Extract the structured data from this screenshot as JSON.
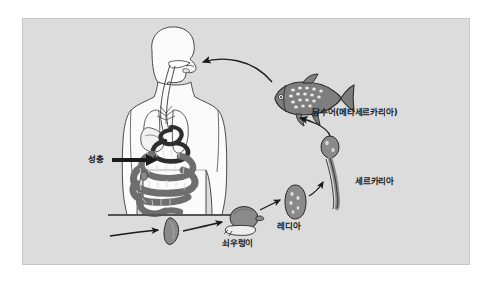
{
  "diagram": {
    "panel": {
      "background_color": "#dcdcdc",
      "border_color": "#c6c6c6"
    },
    "colors": {
      "organism_fill": "#8a8a8a",
      "organism_stroke": "#2b2b2b",
      "worm_fill": "#6e6e6e",
      "worm_dark": "#2e2e2e",
      "body_outline": "#4a4a4a",
      "body_fill": "#fbfbfb",
      "arrow_color": "#1a1a1a",
      "ground_line": "#555555",
      "label_color": "#1a1a1a"
    },
    "stages": [
      {
        "id": "adult",
        "label": "성충",
        "role": "adult-fluke-in-human-host",
        "x": 88,
        "y": 155
      },
      {
        "id": "egg",
        "label": "",
        "role": "egg-shed-to-water",
        "x": 170,
        "y": 228
      },
      {
        "id": "snail",
        "label": "쇠우렁이",
        "role": "first-intermediate-host-snail",
        "x": 222,
        "y": 239
      },
      {
        "id": "redia",
        "label": "레디아",
        "role": "redia-stage-in-snail",
        "x": 277,
        "y": 222
      },
      {
        "id": "cercaria",
        "label": "세르카리아",
        "role": "cercaria-free-swimming",
        "x": 355,
        "y": 177
      },
      {
        "id": "fish",
        "label": "담수어(메타세르카리아)",
        "role": "second-intermediate-host-freshwater-fish",
        "x": 312,
        "y": 108
      }
    ],
    "human": {
      "role": "definitive-host-human",
      "organs": [
        "mouth",
        "esophagus",
        "lungs",
        "liver",
        "intestines"
      ]
    },
    "arrows": [
      {
        "id": "fish-to-mouth",
        "from": "fish",
        "to": "human-mouth"
      },
      {
        "id": "cercaria-to-fish",
        "from": "cercaria",
        "to": "fish"
      },
      {
        "id": "redia-to-cercaria",
        "from": "redia",
        "to": "cercaria"
      },
      {
        "id": "snail-to-redia",
        "from": "snail",
        "to": "redia"
      },
      {
        "id": "egg-to-snail",
        "from": "egg",
        "to": "snail"
      },
      {
        "id": "human-to-egg",
        "from": "human",
        "to": "egg"
      },
      {
        "id": "adult-label-arrow",
        "from": "adult-label",
        "to": "intestines"
      }
    ]
  }
}
